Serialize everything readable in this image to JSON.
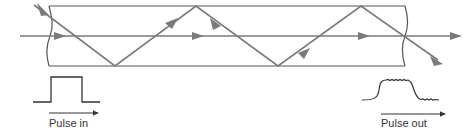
{
  "diagram": {
    "type": "optical-fiber-multimode-dispersion",
    "colors": {
      "fiber_outline": "#555555",
      "ray": "#7a7a7a",
      "pulse": "#333333",
      "text": "#333333"
    },
    "labels": {
      "pulse_in": "Pulse in",
      "pulse_out": "Pulse out"
    },
    "rays": [
      {
        "name": "axial-ray",
        "description": "straight ray along fiber axis"
      },
      {
        "name": "zigzag-ray",
        "description": "ray reflecting off core-cladding boundary"
      }
    ]
  }
}
